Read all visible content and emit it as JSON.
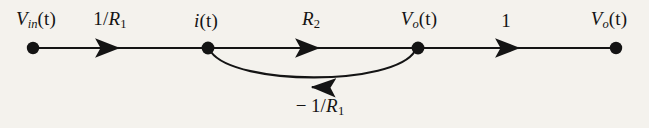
{
  "figure": {
    "type": "signal-flow-graph",
    "background_color": "#f4f2ed",
    "stroke_color": "#141414",
    "width": 649,
    "height": 128
  },
  "nodes": [
    {
      "id": "vin",
      "label_plain": "V_in(t)",
      "var": "V",
      "sub": "in",
      "arg": "(t)",
      "x": 33,
      "y": 48,
      "label_x": 36,
      "label_y": 20
    },
    {
      "id": "i",
      "label_plain": "i(t)",
      "var": "i",
      "sub": "",
      "arg": "(t)",
      "x": 208,
      "y": 48,
      "label_x": 206,
      "label_y": 20
    },
    {
      "id": "vo1",
      "label_plain": "V_o(t)",
      "var": "V",
      "sub": "o",
      "arg": "(t)",
      "x": 418,
      "y": 48,
      "label_x": 419,
      "label_y": 20
    },
    {
      "id": "vo2",
      "label_plain": "V_o(t)",
      "var": "V",
      "sub": "o",
      "arg": "(t)",
      "x": 616,
      "y": 48,
      "label_x": 609,
      "label_y": 20
    }
  ],
  "branches": [
    {
      "id": "b1",
      "from": "vin",
      "to": "i",
      "gain_plain": "1/R_1",
      "gain_num": "1",
      "gain_den_var": "R",
      "gain_den_sub": "1",
      "gain_sign": "",
      "direction": "right",
      "shape": "straight",
      "label_x": 110,
      "label_y": 20,
      "arrow_x": 118,
      "arrow_y": 48
    },
    {
      "id": "b2",
      "from": "i",
      "to": "vo1",
      "gain_plain": "R_2",
      "gain_num": "",
      "gain_den_var": "R",
      "gain_den_sub": "2",
      "gain_sign": "",
      "direction": "right",
      "shape": "straight",
      "label_x": 311,
      "label_y": 20,
      "arrow_x": 318,
      "arrow_y": 48
    },
    {
      "id": "b3",
      "from": "vo1",
      "to": "vo2",
      "gain_plain": "1",
      "gain_num": "1",
      "gain_den_var": "",
      "gain_den_sub": "",
      "gain_sign": "",
      "direction": "right",
      "shape": "straight",
      "label_x": 506,
      "label_y": 20,
      "arrow_x": 518,
      "arrow_y": 48
    },
    {
      "id": "b4",
      "from": "vo1",
      "to": "i",
      "gain_plain": "- 1/R_1",
      "gain_num": "1",
      "gain_den_var": "R",
      "gain_den_sub": "1",
      "gain_sign": "−",
      "direction": "left",
      "shape": "arc-below",
      "label_x": 320,
      "label_y": 107,
      "arrow_x": 313,
      "arrow_y": 87
    }
  ],
  "labels": {
    "minus": "−",
    "slash": "/",
    "paren_t": "(t)"
  }
}
